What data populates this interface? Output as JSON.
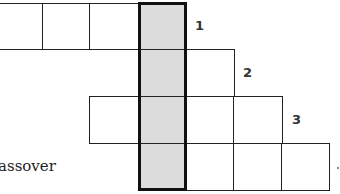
{
  "puzzle": {
    "type": "crossword-grid-fragment",
    "highlight_color": "#dcdcdc",
    "rows": [
      {
        "row": 1,
        "number_label": "1",
        "white_cells": 3,
        "has_shaded": true
      },
      {
        "row": 2,
        "number_label": "2",
        "white_cells_right": 1,
        "has_shaded": true
      },
      {
        "row": 3,
        "number_label": "3",
        "white_cells_left": 1,
        "white_cells_right": 2,
        "has_shaded": true
      },
      {
        "row": 4,
        "number_label": "",
        "white_cells_right": 3,
        "has_shaded": true
      }
    ]
  },
  "labels": {
    "n1": "1",
    "n2": "2",
    "n3": "3"
  },
  "clue": {
    "partial_text": "assover"
  }
}
